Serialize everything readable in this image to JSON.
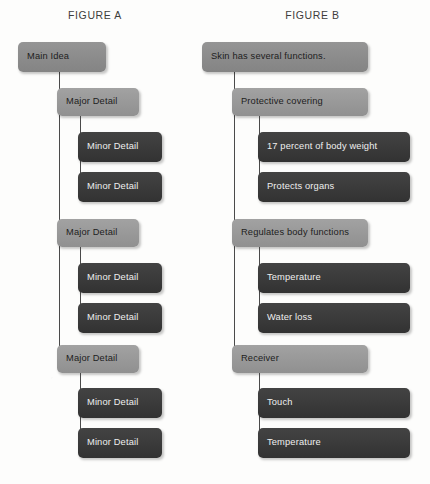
{
  "figures": [
    {
      "title": "FIGURE A",
      "root": {
        "label": "Main Idea"
      },
      "branches": [
        {
          "label": "Major Detail",
          "children": [
            {
              "label": "Minor Detail"
            },
            {
              "label": "Minor Detail"
            }
          ]
        },
        {
          "label": "Major Detail",
          "children": [
            {
              "label": "Minor Detail"
            },
            {
              "label": "Minor Detail"
            }
          ]
        },
        {
          "label": "Major Detail",
          "children": [
            {
              "label": "Minor Detail"
            },
            {
              "label": "Minor Detail"
            }
          ]
        }
      ]
    },
    {
      "title": "FIGURE B",
      "root": {
        "label": "Skin has several functions."
      },
      "branches": [
        {
          "label": "Protective covering",
          "children": [
            {
              "label": "17 percent of body weight"
            },
            {
              "label": "Protects organs"
            }
          ]
        },
        {
          "label": "Regulates body functions",
          "children": [
            {
              "label": "Temperature"
            },
            {
              "label": "Water loss"
            }
          ]
        },
        {
          "label": "Receiver",
          "children": [
            {
              "label": "Touch"
            },
            {
              "label": "Temperature"
            }
          ]
        }
      ]
    }
  ],
  "colors": {
    "level1_box": "#8e8e8e",
    "level2_box": "#9a9a9a",
    "level3_box": "#3b3b3b",
    "level3_text": "#efefef",
    "level1_text": "#1d1d1d",
    "connector": "#4a4a4a",
    "title_text": "#3d3d3d",
    "page_background": "#fdfdfc"
  }
}
